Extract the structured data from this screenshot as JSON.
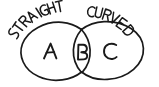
{
  "figure": {
    "kind": "hand-drawn-venn-diagram",
    "background_color": "#ffffff",
    "ink_color": "#1a1a1a",
    "width": 159,
    "height": 87
  },
  "labels": {
    "left_label": "STRAIGHT",
    "right_label": "CURVED"
  },
  "regions": [
    {
      "id": "left-only",
      "letter": "A",
      "meaning": "STRAIGHT only",
      "center_x": 50,
      "center_y": 51
    },
    {
      "id": "intersection",
      "letter": "B",
      "meaning": "STRAIGHT and CURVED",
      "center_x": 82,
      "center_y": 52
    },
    {
      "id": "right-only",
      "letter": "C",
      "meaning": "CURVED only",
      "center_x": 111,
      "center_y": 51
    }
  ],
  "circles": [
    {
      "id": "left-circle",
      "label": "STRAIGHT",
      "center_x": 56,
      "center_y": 51,
      "radius": 28
    },
    {
      "id": "right-circle",
      "label": "CURVED",
      "center_x": 108,
      "center_y": 51,
      "radius": 35
    }
  ]
}
